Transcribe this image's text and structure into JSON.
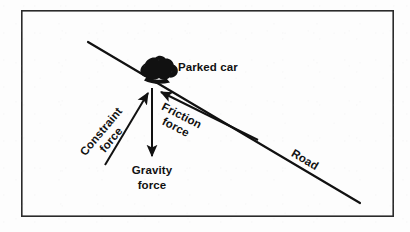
{
  "figure": {
    "kind": "physics-force-diagram",
    "background_color": "#fdfdfd",
    "ink_color": "#111111",
    "frame": {
      "name": "diagram-border",
      "x": 21,
      "y": 10,
      "width": 373,
      "height": 207,
      "stroke_width": 1.6
    },
    "road": {
      "label": "Road",
      "x1": 88,
      "y1": 42,
      "x2": 360,
      "y2": 203,
      "angle_deg": 30.6,
      "stroke_width": 2.2,
      "label_x": 302,
      "label_y": 160
    },
    "car": {
      "label": "Parked car",
      "center_x": 155,
      "center_y": 68,
      "label_x": 178,
      "label_y": 70,
      "fill": "#111111"
    },
    "origin": {
      "x": 152,
      "y": 88
    },
    "forces": [
      {
        "name": "constraint-force",
        "label_line1": "Constraint",
        "label_line2": "force",
        "tail_x": 105,
        "tail_y": 165,
        "head_x": 148,
        "head_y": 92,
        "angle_deg": -50,
        "label_x": 104,
        "label_y": 135,
        "stroke_width": 2.0
      },
      {
        "name": "friction-force",
        "label_line1": "Friction",
        "label_line2": "force",
        "tail_x": 258,
        "tail_y": 140,
        "head_x": 160,
        "head_y": 91,
        "angle_deg": 27,
        "label_x": 176,
        "label_y": 122,
        "stroke_width": 2.0
      },
      {
        "name": "gravity-force",
        "label_line1": "Gravity",
        "label_line2": "force",
        "tail_x": 152,
        "tail_y": 88,
        "head_x": 152,
        "head_y": 158,
        "angle_deg": 90,
        "label_x": 152,
        "label_y": 175,
        "stroke_width": 2.0
      }
    ]
  }
}
